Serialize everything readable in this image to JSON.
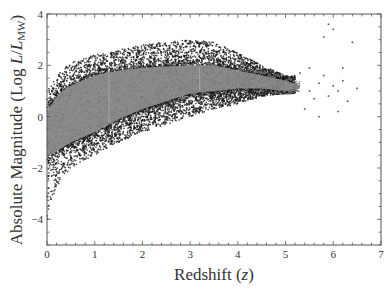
{
  "chart_data": {
    "type": "scatter",
    "title": "",
    "xlabel": "Redshift (z)",
    "xlabel_parts": {
      "main": "Redshift (",
      "italic": "z",
      "end": ")"
    },
    "ylabel": "Absolute Magnitude (Log L/L_MW)",
    "ylabel_parts": {
      "main": "Absolute Magnitude (Log ",
      "italic_L": "L",
      "slash": "/",
      "italic_L2": "L",
      "sub": "MW",
      "end": ")"
    },
    "xlim": [
      0,
      7
    ],
    "ylim": [
      -5,
      4
    ],
    "xticks": [
      "0",
      "1",
      "2",
      "3",
      "4",
      "5",
      "6",
      "7"
    ],
    "yticks": [
      "4",
      "2",
      "0",
      "−2",
      "−4"
    ],
    "ytick_values": [
      4,
      2,
      0,
      -2,
      -4
    ],
    "grid": false,
    "legend": null,
    "series": [
      {
        "name": "dense core (gray)",
        "color": "#8a8a8a",
        "description": "Dense gray band of galaxies rising from ~-1.5 at z=0 to ~1.5 at z=3-4, fading out near z=5.2",
        "band": {
          "z": [
            0.0,
            0.25,
            0.5,
            1.0,
            1.5,
            2.0,
            2.5,
            3.0,
            3.5,
            4.0,
            4.5,
            5.0,
            5.3
          ],
          "upper": [
            0.2,
            0.9,
            1.2,
            1.6,
            1.8,
            1.9,
            1.95,
            2.0,
            2.0,
            1.8,
            1.6,
            1.4,
            1.2
          ],
          "lower": [
            -1.6,
            -1.3,
            -1.0,
            -0.6,
            -0.1,
            0.3,
            0.6,
            0.9,
            1.0,
            1.1,
            1.1,
            1.0,
            1.1
          ]
        }
      },
      {
        "name": "sparse envelope (black)",
        "color": "#1a1a1a",
        "description": "Dark scattered points framing the band above and below; lower envelope from ~-4.8 at z=0 up to ~0.5 at z=4",
        "envelope": {
          "z": [
            0.0,
            0.1,
            0.3,
            0.5,
            1.0,
            1.5,
            2.0,
            2.5,
            3.0,
            3.5,
            4.0,
            4.5,
            5.0
          ],
          "upper": [
            1.0,
            1.3,
            1.8,
            2.1,
            2.4,
            2.6,
            2.8,
            2.9,
            3.0,
            2.9,
            2.5,
            2.0,
            1.6
          ],
          "lower": [
            -4.9,
            -3.2,
            -2.4,
            -2.0,
            -1.5,
            -1.0,
            -0.6,
            -0.3,
            0.0,
            0.3,
            0.5,
            0.8,
            0.9
          ]
        }
      },
      {
        "name": "high-z outliers",
        "color": "#555555",
        "points": [
          [
            5.5,
            1.0
          ],
          [
            5.6,
            0.7
          ],
          [
            5.7,
            1.3
          ],
          [
            5.8,
            1.6
          ],
          [
            5.9,
            0.8
          ],
          [
            6.0,
            1.2
          ],
          [
            6.1,
            1.0
          ],
          [
            6.2,
            1.4
          ],
          [
            6.3,
            0.6
          ],
          [
            6.4,
            2.9
          ],
          [
            5.9,
            3.6
          ],
          [
            6.0,
            3.4
          ],
          [
            5.5,
            1.9
          ],
          [
            5.7,
            0.0
          ],
          [
            6.1,
            0.2
          ],
          [
            5.4,
            0.3
          ],
          [
            5.8,
            3.1
          ],
          [
            6.2,
            1.9
          ],
          [
            6.5,
            1.1
          ],
          [
            5.3,
            1.7
          ]
        ]
      }
    ],
    "annotations": []
  }
}
